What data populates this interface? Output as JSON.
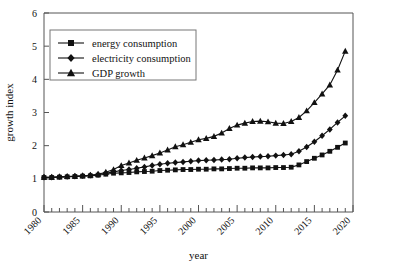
{
  "chart_data": {
    "type": "line",
    "title": "",
    "subtitle": "",
    "xlabel": "year",
    "ylabel": "growth index",
    "xlim": [
      1980,
      2020
    ],
    "ylim": [
      0,
      6
    ],
    "ytick_values": [
      0,
      1,
      2,
      3,
      4,
      5,
      6
    ],
    "ytick_labels": [
      "0",
      "1",
      "2",
      "3",
      "4",
      "5",
      "6"
    ],
    "xtick_values": [
      1980,
      1985,
      1990,
      1995,
      2000,
      2005,
      2010,
      2015,
      2020
    ],
    "xtick_labels": [
      "1980",
      "1985",
      "1990",
      "1995",
      "2000",
      "2005",
      "2010",
      "2015",
      "2020"
    ],
    "xtick_minor_step": 1,
    "xtick_label_rotation_deg": 45,
    "grid": false,
    "legend_position": "upper-left-inside",
    "x": [
      1980,
      1981,
      1982,
      1983,
      1984,
      1985,
      1986,
      1987,
      1988,
      1989,
      1990,
      1991,
      1992,
      1993,
      1994,
      1995,
      1996,
      1997,
      1998,
      1999,
      2000,
      2001,
      2002,
      2003,
      2004,
      2005,
      2006,
      2007,
      2008,
      2009,
      2010,
      2011,
      2012,
      2013,
      2014,
      2015,
      2016,
      2017,
      2018,
      2019
    ],
    "series": [
      {
        "name": "energy consumption",
        "marker": "square",
        "values": [
          1.04,
          1.04,
          1.05,
          1.06,
          1.07,
          1.08,
          1.09,
          1.11,
          1.14,
          1.17,
          1.18,
          1.19,
          1.21,
          1.22,
          1.23,
          1.25,
          1.26,
          1.27,
          1.28,
          1.28,
          1.29,
          1.29,
          1.3,
          1.3,
          1.31,
          1.32,
          1.32,
          1.33,
          1.33,
          1.33,
          1.34,
          1.34,
          1.35,
          1.42,
          1.52,
          1.62,
          1.72,
          1.83,
          1.95,
          2.08
        ]
      },
      {
        "name": "electricity consumption",
        "marker": "diamond",
        "values": [
          1.05,
          1.05,
          1.06,
          1.07,
          1.08,
          1.09,
          1.11,
          1.13,
          1.17,
          1.21,
          1.25,
          1.28,
          1.32,
          1.36,
          1.4,
          1.44,
          1.47,
          1.49,
          1.51,
          1.53,
          1.55,
          1.56,
          1.57,
          1.58,
          1.59,
          1.62,
          1.64,
          1.66,
          1.67,
          1.68,
          1.7,
          1.72,
          1.74,
          1.83,
          1.96,
          2.12,
          2.3,
          2.49,
          2.7,
          2.9
        ]
      },
      {
        "name": "GDP growth",
        "marker": "triangle",
        "values": [
          1.05,
          1.05,
          1.06,
          1.07,
          1.08,
          1.09,
          1.11,
          1.14,
          1.2,
          1.28,
          1.4,
          1.48,
          1.56,
          1.63,
          1.7,
          1.78,
          1.87,
          1.97,
          2.03,
          2.1,
          2.18,
          2.22,
          2.28,
          2.38,
          2.52,
          2.62,
          2.68,
          2.73,
          2.74,
          2.72,
          2.68,
          2.67,
          2.73,
          2.85,
          3.05,
          3.3,
          3.56,
          3.83,
          4.28,
          4.85
        ]
      }
    ]
  },
  "legend": {
    "items": [
      {
        "label": "energy consumption"
      },
      {
        "label": "electricity consumption"
      },
      {
        "label": "GDP growth"
      }
    ]
  },
  "colors": {
    "ink": "#111111",
    "axis": "#555555",
    "legend_border": "#777777",
    "background": "#ffffff"
  }
}
